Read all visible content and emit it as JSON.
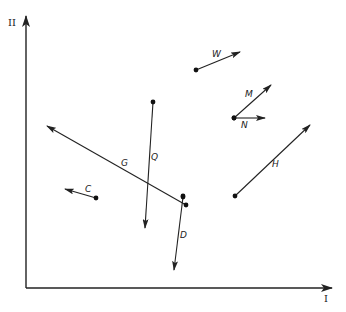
{
  "axes": {
    "x_label": "I",
    "y_label": "II",
    "origin": [
      26,
      288
    ],
    "x_end": [
      332,
      288
    ],
    "y_end": [
      26,
      16
    ]
  },
  "vectors": [
    {
      "name": "W",
      "tail": [
        196,
        70
      ],
      "head": [
        240,
        52
      ],
      "label_pos": [
        212,
        57
      ]
    },
    {
      "name": "M",
      "tail": [
        234,
        118
      ],
      "head": [
        271,
        85
      ],
      "label_pos": [
        245,
        97
      ]
    },
    {
      "name": "N",
      "tail": [
        234,
        118
      ],
      "head": [
        265,
        118
      ],
      "label_pos": [
        241,
        128
      ]
    },
    {
      "name": "H",
      "tail": [
        235,
        196
      ],
      "head": [
        310,
        125
      ],
      "label_pos": [
        272,
        167
      ]
    },
    {
      "name": "Q",
      "tail": [
        153,
        102
      ],
      "head": [
        145,
        228
      ],
      "label_pos": [
        151,
        160
      ]
    },
    {
      "name": "G",
      "tail": [
        186,
        205
      ],
      "head": [
        47,
        126
      ],
      "label_pos": [
        121,
        166
      ]
    },
    {
      "name": "C",
      "tail": [
        96,
        198
      ],
      "head": [
        65,
        189
      ],
      "label_pos": [
        85,
        192
      ]
    },
    {
      "name": "D",
      "tail": [
        183,
        197
      ],
      "head": [
        174,
        270
      ],
      "label_pos": [
        180,
        238
      ]
    }
  ],
  "extra_points": [
    [
      183,
      196
    ]
  ]
}
